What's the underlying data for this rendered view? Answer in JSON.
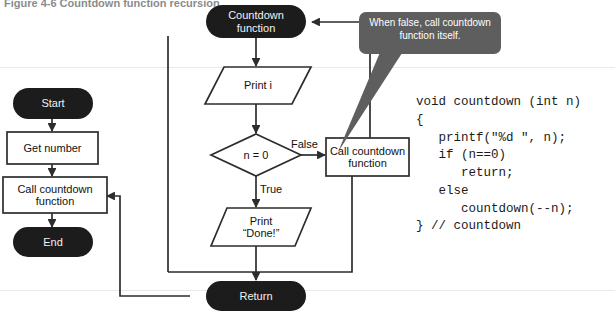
{
  "figure": {
    "caption": "Figure 4-6   Countdown function recursion"
  },
  "colors": {
    "terminator_fill": "#1c1c1c",
    "terminator_text": "#f2f2f2",
    "shape_stroke": "#333333",
    "shape_fill": "#ffffff",
    "callout_fill": "#5e5e5e",
    "callout_text": "#ffffff",
    "connector": "#2d2d2d",
    "code_text": "#1b1b1b",
    "page_background": "#ffffff"
  },
  "main_flow": {
    "title": "main routine",
    "nodes": [
      {
        "id": "start",
        "type": "terminator",
        "label": "Start"
      },
      {
        "id": "get-number",
        "type": "process",
        "label": "Get number"
      },
      {
        "id": "call-countdown",
        "type": "process",
        "label": "Call countdown\nfunction"
      },
      {
        "id": "end",
        "type": "terminator",
        "label": "End"
      }
    ]
  },
  "function_flow": {
    "title": "countdown function",
    "nodes": [
      {
        "id": "countdown-function",
        "type": "terminator",
        "label": "Countdown\nfunction"
      },
      {
        "id": "print-i",
        "type": "input-output",
        "label": "Print i"
      },
      {
        "id": "decision-n-zero",
        "type": "decision",
        "label": "n = 0"
      },
      {
        "id": "call-countdown-recursive",
        "type": "process",
        "label": "Call countdown\nfunction"
      },
      {
        "id": "print-done",
        "type": "input-output",
        "label": "Print\n“Done!”"
      },
      {
        "id": "return",
        "type": "terminator",
        "label": "Return"
      }
    ],
    "edge_labels": {
      "false": "False",
      "true": "True"
    }
  },
  "callout": {
    "text": "When false, call countdown function itself."
  },
  "code": {
    "language": "C",
    "lines": [
      "void countdown (int n)",
      "{",
      "   printf(\"%d \", n);",
      "   if (n==0)",
      "      return;",
      "   else",
      "      countdown(--n);",
      "} // countdown"
    ]
  }
}
